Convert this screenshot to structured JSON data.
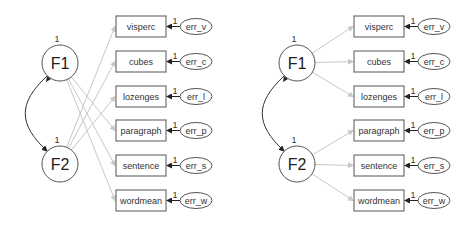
{
  "diagrams": [
    {
      "id": "left",
      "description": "Cross-loaded CFA (F1 -> verbal, F2 -> visual)",
      "latents": [
        {
          "label": "F1",
          "variance": "1",
          "cx": 60,
          "cy": 63
        },
        {
          "label": "F2",
          "variance": "1",
          "cx": 60,
          "cy": 164
        }
      ],
      "indicators": [
        {
          "label": "visperc",
          "error": "err_v",
          "loading_label": "1",
          "factor": "F2"
        },
        {
          "label": "cubes",
          "error": "err_c",
          "loading_label": "1",
          "factor": "F2"
        },
        {
          "label": "lozenges",
          "error": "err_l",
          "loading_label": "1",
          "factor": "F2"
        },
        {
          "label": "paragraph",
          "error": "err_p",
          "loading_label": "1",
          "factor": "F1"
        },
        {
          "label": "sentence",
          "error": "err_s",
          "loading_label": "1",
          "factor": "F1"
        },
        {
          "label": "wordmean",
          "error": "err_w",
          "loading_label": "1",
          "factor": "F1"
        }
      ]
    },
    {
      "id": "right",
      "description": "Standard CFA (F1 -> visual, F2 -> verbal)",
      "latents": [
        {
          "label": "F1",
          "variance": "1",
          "cx": 297,
          "cy": 63
        },
        {
          "label": "F2",
          "variance": "1",
          "cx": 297,
          "cy": 164
        }
      ],
      "indicators": [
        {
          "label": "visperc",
          "error": "err_v",
          "loading_label": "1",
          "factor": "F1"
        },
        {
          "label": "cubes",
          "error": "err_c",
          "loading_label": "1",
          "factor": "F1"
        },
        {
          "label": "lozenges",
          "error": "err_l",
          "loading_label": "1",
          "factor": "F1"
        },
        {
          "label": "paragraph",
          "error": "err_p",
          "loading_label": "1",
          "factor": "F2"
        },
        {
          "label": "sentence",
          "error": "err_s",
          "loading_label": "1",
          "factor": "F2"
        },
        {
          "label": "wordmean",
          "error": "err_w",
          "loading_label": "1",
          "factor": "F2"
        }
      ]
    }
  ],
  "colors": {
    "loading_path": "#c8c8c8",
    "error_path": "#222222",
    "node_stroke": "#555555",
    "background": "#ffffff"
  }
}
